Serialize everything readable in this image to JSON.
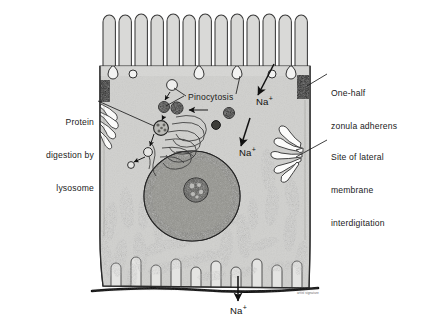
{
  "figure": {
    "kind": "cell-diagram",
    "style": "grayscale pen-and-ink electron micrograph illustration",
    "background_color": "#ffffff",
    "cytoplasm_color": "#d9d9d7",
    "outline_color": "#2b2b2b",
    "nucleus_color": "#8f8f8c",
    "mitochondria_color": "#9a9a97",
    "signature": "artist signature"
  },
  "labels": {
    "zonula": {
      "line1": "One-half",
      "line2": "zonula adherens"
    },
    "interdigitation": {
      "line1": "Site of lateral",
      "line2": "membrane",
      "line3": "interdigitation"
    },
    "lysosome": {
      "line1": "Protein",
      "line2": "digestion by",
      "line3": "lysosome"
    },
    "pinocytosis": {
      "text": "Pinocytosis"
    }
  },
  "ions": {
    "sodium_symbol": "Na",
    "sodium_charge": "+",
    "apical": {
      "id": "na-apical"
    },
    "lateral": {
      "id": "na-lateral"
    },
    "basal": {
      "id": "na-basal"
    }
  },
  "structures": {
    "microvilli_count": 13,
    "pinocytotic_vesicles": 6,
    "mitochondria_count": 27,
    "nucleolus": "present",
    "golgi": "present",
    "basement_membrane": "present"
  }
}
